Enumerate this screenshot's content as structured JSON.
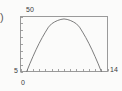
{
  "figure": {
    "stray_glyph": ")",
    "background_color": "#fbfbfa",
    "frame_color": "#9a9a9a",
    "curve_color": "#6e6e6e",
    "tick_color": "#8c8c8c",
    "text_color": "#3a3a3a"
  },
  "chart_data": {
    "type": "line",
    "title": "",
    "subtitle": "",
    "xlabel": "",
    "ylabel": "",
    "grid": false,
    "legend": false,
    "legend_position": "none",
    "xlim": [
      0,
      14
    ],
    "ylim": [
      5,
      50
    ],
    "x_tick_labels": [
      "0",
      "14"
    ],
    "y_tick_labels": [
      "5",
      "50"
    ],
    "x_tick_count": 14,
    "y_tick_count": 9,
    "series": [
      {
        "name": "parabola",
        "color": "#6e6e6e",
        "x": [
          1.0,
          1.5,
          2.0,
          2.5,
          3.0,
          3.5,
          4.0,
          4.5,
          5.0,
          5.5,
          6.0,
          6.5,
          7.0,
          7.5,
          8.0,
          8.5,
          9.0,
          9.5,
          10.0,
          10.5,
          11.0,
          11.5,
          12.0,
          12.5,
          13.0
        ],
        "y": [
          5.0,
          11.3,
          17.2,
          22.8,
          28.0,
          32.8,
          37.2,
          41.3,
          44.0,
          45.6,
          46.8,
          47.6,
          48.0,
          47.6,
          46.8,
          45.6,
          44.0,
          41.3,
          37.2,
          32.8,
          28.0,
          22.8,
          17.2,
          11.3,
          5.0
        ]
      }
    ],
    "annotations": []
  }
}
